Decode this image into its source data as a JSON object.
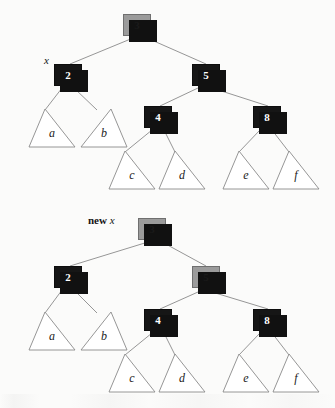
{
  "figure": {
    "background_color": "#fbfbfa",
    "node_black_color": "#161616",
    "node_gray_color": "#9b9b9b",
    "node_shadow_color": "#111111",
    "edge_color": "#8a8a8a",
    "triangle_stroke_color": "#8a8a8a"
  },
  "panels": [
    {
      "id": "before",
      "pointer": {
        "prefix": "",
        "name": "x",
        "target": "node-2"
      },
      "nodes": [
        {
          "id": "node-3",
          "value": "3",
          "color": "gray",
          "x": 123,
          "y": 14,
          "role": "root"
        },
        {
          "id": "node-2",
          "value": "2",
          "color": "black",
          "x": 54,
          "y": 64,
          "role": "left-child"
        },
        {
          "id": "node-5",
          "value": "5",
          "color": "black",
          "x": 192,
          "y": 64,
          "role": "right-child"
        },
        {
          "id": "node-4",
          "value": "4",
          "color": "black",
          "x": 144,
          "y": 106,
          "role": "left-grandchild"
        },
        {
          "id": "node-8",
          "value": "8",
          "color": "black",
          "x": 253,
          "y": 106,
          "role": "right-grandchild"
        }
      ],
      "subtrees": [
        {
          "id": "tri-a",
          "label": "a",
          "x": 28,
          "y": 108
        },
        {
          "id": "tri-b",
          "label": "b",
          "x": 80,
          "y": 108
        },
        {
          "id": "tri-c",
          "label": "c",
          "x": 108,
          "y": 150
        },
        {
          "id": "tri-d",
          "label": "d",
          "x": 158,
          "y": 150
        },
        {
          "id": "tri-e",
          "label": "e",
          "x": 222,
          "y": 150
        },
        {
          "id": "tri-f",
          "label": "f",
          "x": 272,
          "y": 150
        }
      ]
    },
    {
      "id": "after",
      "pointer": {
        "prefix": "new",
        "name": "x",
        "target": "node-3"
      },
      "nodes": [
        {
          "id": "node-3",
          "value": "3",
          "color": "gray",
          "x": 138,
          "y": 218,
          "role": "root"
        },
        {
          "id": "node-2",
          "value": "2",
          "color": "black",
          "x": 54,
          "y": 266,
          "role": "left-child"
        },
        {
          "id": "node-5",
          "value": "5",
          "color": "gray",
          "x": 192,
          "y": 266,
          "role": "right-child"
        },
        {
          "id": "node-4",
          "value": "4",
          "color": "black",
          "x": 144,
          "y": 309,
          "role": "left-grandchild"
        },
        {
          "id": "node-8",
          "value": "8",
          "color": "black",
          "x": 253,
          "y": 309,
          "role": "right-grandchild"
        }
      ],
      "subtrees": [
        {
          "id": "tri-a",
          "label": "a",
          "x": 28,
          "y": 311
        },
        {
          "id": "tri-b",
          "label": "b",
          "x": 80,
          "y": 311
        },
        {
          "id": "tri-c",
          "label": "c",
          "x": 108,
          "y": 353
        },
        {
          "id": "tri-d",
          "label": "d",
          "x": 158,
          "y": 353
        },
        {
          "id": "tri-e",
          "label": "e",
          "x": 222,
          "y": 353
        },
        {
          "id": "tri-f",
          "label": "f",
          "x": 272,
          "y": 353
        }
      ]
    }
  ],
  "labels": {
    "pointer_x": "x",
    "pointer_new": "new",
    "values": [
      "3",
      "2",
      "5",
      "4",
      "8"
    ],
    "subtree_names": [
      "a",
      "b",
      "c",
      "d",
      "e",
      "f"
    ]
  }
}
